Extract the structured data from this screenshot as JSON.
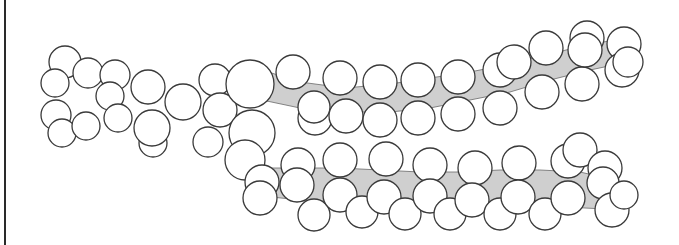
{
  "diagram": {
    "type": "space-filling molecular model",
    "colors": {
      "atom_fill": "#ffffff",
      "atom_stroke": "#3a3a3a",
      "backbone_shade": "#cfcfcf",
      "frame_line": "#2a2a2a"
    },
    "bands": [
      {
        "name": "upper-tail-backbone",
        "points": "262,70 300,82 345,88 390,84 430,78 470,72 510,64 550,54 590,44 630,38 628,62 590,70 550,80 510,92 470,100 430,108 390,112 345,112 300,108 262,100"
      },
      {
        "name": "lower-tail-backbone",
        "points": "262,168 300,168 340,168 380,170 420,172 460,172 500,170 540,170 580,172 615,180 625,210 585,208 540,205 500,206 460,206 420,204 380,204 340,202 300,200 262,196"
      }
    ],
    "atoms": [
      {
        "cx": 65,
        "cy": 62,
        "r": 16
      },
      {
        "cx": 55,
        "cy": 83,
        "r": 14
      },
      {
        "cx": 88,
        "cy": 73,
        "r": 15
      },
      {
        "cx": 56,
        "cy": 115,
        "r": 15
      },
      {
        "cx": 62,
        "cy": 133,
        "r": 14
      },
      {
        "cx": 86,
        "cy": 126,
        "r": 14
      },
      {
        "cx": 115,
        "cy": 75,
        "r": 15
      },
      {
        "cx": 110,
        "cy": 96,
        "r": 14
      },
      {
        "cx": 118,
        "cy": 118,
        "r": 14
      },
      {
        "cx": 148,
        "cy": 87,
        "r": 17
      },
      {
        "cx": 153,
        "cy": 143,
        "r": 14
      },
      {
        "cx": 152,
        "cy": 128,
        "r": 18
      },
      {
        "cx": 183,
        "cy": 102,
        "r": 18
      },
      {
        "cx": 215,
        "cy": 80,
        "r": 16
      },
      {
        "cx": 220,
        "cy": 110,
        "r": 17
      },
      {
        "cx": 208,
        "cy": 142,
        "r": 15
      },
      {
        "cx": 250,
        "cy": 84,
        "r": 24
      },
      {
        "cx": 252,
        "cy": 133,
        "r": 23
      },
      {
        "cx": 245,
        "cy": 160,
        "r": 20
      },
      {
        "cx": 293,
        "cy": 72,
        "r": 17
      },
      {
        "cx": 315,
        "cy": 118,
        "r": 17
      },
      {
        "cx": 314,
        "cy": 107,
        "r": 16
      },
      {
        "cx": 340,
        "cy": 78,
        "r": 17
      },
      {
        "cx": 346,
        "cy": 116,
        "r": 17
      },
      {
        "cx": 380,
        "cy": 82,
        "r": 17
      },
      {
        "cx": 380,
        "cy": 120,
        "r": 17
      },
      {
        "cx": 418,
        "cy": 80,
        "r": 17
      },
      {
        "cx": 418,
        "cy": 118,
        "r": 17
      },
      {
        "cx": 458,
        "cy": 77,
        "r": 17
      },
      {
        "cx": 458,
        "cy": 114,
        "r": 17
      },
      {
        "cx": 500,
        "cy": 70,
        "r": 17
      },
      {
        "cx": 500,
        "cy": 108,
        "r": 17
      },
      {
        "cx": 514,
        "cy": 62,
        "r": 17
      },
      {
        "cx": 542,
        "cy": 92,
        "r": 17
      },
      {
        "cx": 546,
        "cy": 48,
        "r": 17
      },
      {
        "cx": 582,
        "cy": 84,
        "r": 17
      },
      {
        "cx": 587,
        "cy": 38,
        "r": 17
      },
      {
        "cx": 585,
        "cy": 50,
        "r": 17
      },
      {
        "cx": 624,
        "cy": 44,
        "r": 17
      },
      {
        "cx": 622,
        "cy": 70,
        "r": 17
      },
      {
        "cx": 628,
        "cy": 62,
        "r": 15
      },
      {
        "cx": 262,
        "cy": 182,
        "r": 17
      },
      {
        "cx": 298,
        "cy": 165,
        "r": 17
      },
      {
        "cx": 297,
        "cy": 185,
        "r": 17
      },
      {
        "cx": 260,
        "cy": 198,
        "r": 17
      },
      {
        "cx": 314,
        "cy": 215,
        "r": 16
      },
      {
        "cx": 340,
        "cy": 160,
        "r": 17
      },
      {
        "cx": 340,
        "cy": 195,
        "r": 17
      },
      {
        "cx": 362,
        "cy": 212,
        "r": 16
      },
      {
        "cx": 386,
        "cy": 159,
        "r": 17
      },
      {
        "cx": 384,
        "cy": 197,
        "r": 17
      },
      {
        "cx": 405,
        "cy": 214,
        "r": 16
      },
      {
        "cx": 430,
        "cy": 165,
        "r": 17
      },
      {
        "cx": 430,
        "cy": 196,
        "r": 17
      },
      {
        "cx": 450,
        "cy": 214,
        "r": 16
      },
      {
        "cx": 475,
        "cy": 168,
        "r": 17
      },
      {
        "cx": 472,
        "cy": 200,
        "r": 17
      },
      {
        "cx": 500,
        "cy": 214,
        "r": 16
      },
      {
        "cx": 519,
        "cy": 163,
        "r": 17
      },
      {
        "cx": 518,
        "cy": 197,
        "r": 17
      },
      {
        "cx": 545,
        "cy": 214,
        "r": 16
      },
      {
        "cx": 568,
        "cy": 161,
        "r": 17
      },
      {
        "cx": 568,
        "cy": 198,
        "r": 17
      },
      {
        "cx": 580,
        "cy": 150,
        "r": 17
      },
      {
        "cx": 605,
        "cy": 168,
        "r": 17
      },
      {
        "cx": 603,
        "cy": 183,
        "r": 16
      },
      {
        "cx": 612,
        "cy": 210,
        "r": 17
      },
      {
        "cx": 624,
        "cy": 195,
        "r": 14
      }
    ]
  }
}
